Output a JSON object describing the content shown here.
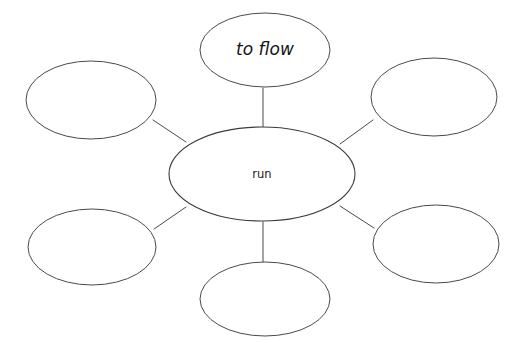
{
  "diagram": {
    "type": "word-web",
    "title": "",
    "canvas": {
      "width": 522,
      "height": 351,
      "background": "#ffffff"
    },
    "stroke_color": "#4a4a4a",
    "text_color": "#1a1a1a",
    "center": {
      "id": "center-bubble",
      "label": "run",
      "cx": 262,
      "cy": 174,
      "rx": 93,
      "ry": 47,
      "style": "plain"
    },
    "nodes": [
      {
        "id": "bubble-top",
        "label": "to flow",
        "cx": 265,
        "cy": 50,
        "rx": 65,
        "ry": 37,
        "style": "script",
        "filled": true
      },
      {
        "id": "bubble-top-left",
        "label": "",
        "cx": 91,
        "cy": 100,
        "rx": 65,
        "ry": 39,
        "style": "plain",
        "filled": false
      },
      {
        "id": "bubble-top-right",
        "label": "",
        "cx": 434,
        "cy": 97,
        "rx": 63,
        "ry": 39,
        "style": "plain",
        "filled": false
      },
      {
        "id": "bubble-bottom-left",
        "label": "",
        "cx": 92,
        "cy": 247,
        "rx": 64,
        "ry": 38,
        "style": "plain",
        "filled": false
      },
      {
        "id": "bubble-bottom-right",
        "label": "",
        "cx": 436,
        "cy": 244,
        "rx": 63,
        "ry": 39,
        "style": "plain",
        "filled": false
      },
      {
        "id": "bubble-bottom",
        "label": "",
        "cx": 265,
        "cy": 299,
        "rx": 65,
        "ry": 37,
        "style": "plain",
        "filled": false
      }
    ],
    "connectors": [
      {
        "id": "connector-top",
        "from": "center-bubble",
        "to": "bubble-top",
        "x1": 263,
        "y1": 127,
        "x2": 263,
        "y2": 88
      },
      {
        "id": "connector-top-left",
        "from": "center-bubble",
        "to": "bubble-top-left",
        "x1": 186,
        "y1": 142,
        "x2": 153,
        "y2": 120
      },
      {
        "id": "connector-top-right",
        "from": "center-bubble",
        "to": "bubble-top-right",
        "x1": 340,
        "y1": 144,
        "x2": 373,
        "y2": 120
      },
      {
        "id": "connector-bottom-left",
        "from": "center-bubble",
        "to": "bubble-bottom-left",
        "x1": 186,
        "y1": 207,
        "x2": 154,
        "y2": 229
      },
      {
        "id": "connector-bottom-right",
        "from": "center-bubble",
        "to": "bubble-bottom-right",
        "x1": 340,
        "y1": 206,
        "x2": 374,
        "y2": 228
      },
      {
        "id": "connector-bottom",
        "from": "center-bubble",
        "to": "bubble-bottom",
        "x1": 263,
        "y1": 222,
        "x2": 263,
        "y2": 262
      }
    ]
  }
}
